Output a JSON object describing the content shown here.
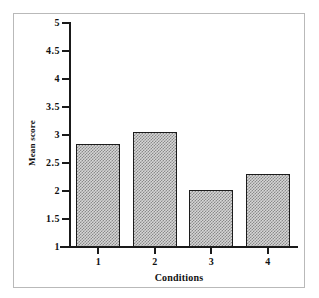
{
  "chart_data": {
    "type": "bar",
    "title": "",
    "subtitle": "",
    "xlabel": "Conditions",
    "ylabel": "Mean score",
    "categories": [
      "1",
      "2",
      "3",
      "4"
    ],
    "values": [
      2.84,
      3.05,
      2.02,
      2.3
    ],
    "series": [
      {
        "name": "Mean score",
        "values": [
          2.84,
          3.05,
          2.02,
          2.3
        ]
      }
    ],
    "ylim": [
      1,
      5
    ],
    "xlim": [
      0,
      4
    ],
    "y_ticks": [
      "1",
      "1.5",
      "2",
      "2.5",
      "3",
      "3.5",
      "4",
      "4.5",
      "5"
    ],
    "y_tick_values": [
      1,
      1.5,
      2,
      2.5,
      3,
      3.5,
      4,
      4.5,
      5
    ],
    "x_ticks": [
      "1",
      "2",
      "3",
      "4"
    ],
    "grid": false,
    "legend": false,
    "legend_position": "none",
    "bar_fill": "#d6d6d6",
    "bar_pattern": "checkerboard-dither",
    "bar_edge_color": "#1c1c1c",
    "frame_color": "#b9b9b9",
    "background": "#ffffff",
    "annotations": []
  }
}
